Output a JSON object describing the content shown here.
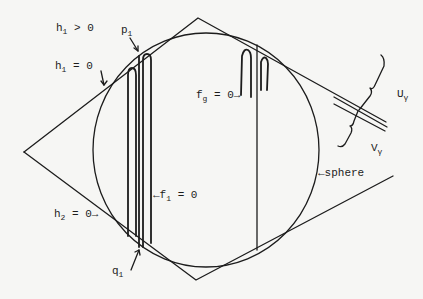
{
  "figure": {
    "labels": {
      "h1_positive": {
        "base": "h",
        "sub": "1",
        "rest": " > 0"
      },
      "h1_zero": {
        "base": "h",
        "sub": "1",
        "rest": " = 0"
      },
      "p1": {
        "base": "p",
        "sub": "1",
        "rest": ""
      },
      "fg_zero": {
        "base": "f",
        "sub": "g",
        "rest": " = 0→"
      },
      "f1_zero": {
        "prefix": "←",
        "base": "f",
        "sub": "1",
        "rest": " = 0"
      },
      "h2_zero": {
        "base": "h",
        "sub": "2",
        "rest": " = 0→"
      },
      "q1": {
        "base": "q",
        "sub": "1",
        "rest": ""
      },
      "sphere": {
        "text": "←sphere"
      },
      "U_gamma": {
        "base": "U",
        "sub": "γ"
      },
      "V_gamma": {
        "base": "V",
        "sub": "γ"
      }
    },
    "shapes": {
      "sphere": {
        "cx": 206,
        "cy": 150,
        "rx": 113,
        "ry": 117
      },
      "diamond_vertices": {
        "top": [
          198,
          18
        ],
        "left": [
          24,
          152
        ],
        "bottom": [
          196,
          280
        ],
        "right_top_end": [
          393,
          118
        ],
        "right_bottom_end": [
          393,
          176
        ]
      }
    }
  }
}
